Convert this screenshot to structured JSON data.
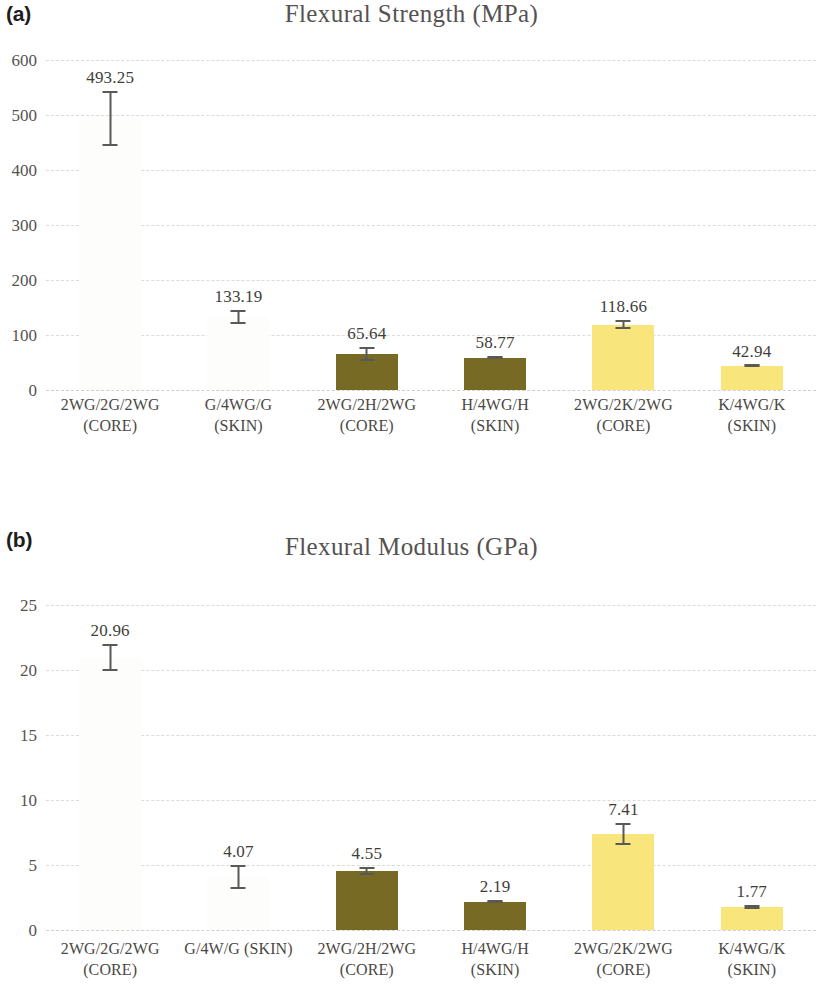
{
  "figure": {
    "panels": [
      {
        "panel_label": "(a)",
        "title": "Flexural Strength (MPa)"
      },
      {
        "panel_label": "(b)",
        "title": "Flexural Modulus (GPa)"
      }
    ]
  },
  "chart_data": [
    {
      "type": "bar",
      "panel": "(a)",
      "title": "Flexural Strength (MPa)",
      "xlabel": "",
      "ylabel": "",
      "ylim": [
        0,
        600
      ],
      "yticks": [
        0,
        100,
        200,
        300,
        400,
        500,
        600
      ],
      "ytick_labels": [
        "0",
        "100",
        "200",
        "300",
        "400",
        "500",
        "600"
      ],
      "grid": true,
      "legend": "none",
      "categories": [
        "2WG/2G/2WG\n(CORE)",
        "G/4WG/G\n(SKIN)",
        "2WG/2H/2WG\n(CORE)",
        "H/4WG/H\n(SKIN)",
        "2WG/2K/2WG\n(CORE)",
        "K/4WG/K\n(SKIN)"
      ],
      "values": [
        493.25,
        133.19,
        65.64,
        58.77,
        118.66,
        42.94
      ],
      "value_labels": [
        "493.25",
        "133.19",
        "65.64",
        "58.77",
        "118.66",
        "42.94"
      ],
      "errors": [
        50.0,
        13.0,
        13.0,
        2.5,
        8.0,
        2.0
      ],
      "bar_colors": [
        "#fdfdfc",
        "#fdfdfc",
        "#776a24",
        "#776a24",
        "#f8e57c",
        "#f8e57c"
      ],
      "bar_styles": [
        "blank",
        "blank",
        "olive",
        "olive",
        "yellow",
        "yellow"
      ]
    },
    {
      "type": "bar",
      "panel": "(b)",
      "title": "Flexural Modulus (GPa)",
      "xlabel": "",
      "ylabel": "",
      "ylim": [
        0,
        25
      ],
      "yticks": [
        0,
        5,
        10,
        15,
        20,
        25
      ],
      "ytick_labels": [
        "0",
        "5",
        "10",
        "15",
        "20",
        "25"
      ],
      "grid": true,
      "legend": "none",
      "categories": [
        "2WG/2G/2WG\n(CORE)",
        "G/4W/G (SKIN)",
        "2WG/2H/2WG\n(CORE)",
        "H/4WG/H\n(SKIN)",
        "2WG/2K/2WG\n(CORE)",
        "K/4WG/K\n(SKIN)"
      ],
      "values": [
        20.96,
        4.07,
        4.55,
        2.19,
        7.41,
        1.77
      ],
      "value_labels": [
        "20.96",
        "4.07",
        "4.55",
        "2.19",
        "7.41",
        "1.77"
      ],
      "errors": [
        1.05,
        0.95,
        0.28,
        0.13,
        0.85,
        0.18
      ],
      "bar_colors": [
        "#fdfdfc",
        "#fdfdfc",
        "#776a24",
        "#776a24",
        "#f8e57c",
        "#f8e57c"
      ],
      "bar_styles": [
        "blank",
        "blank",
        "olive",
        "olive",
        "yellow",
        "yellow"
      ]
    }
  ],
  "colors": {
    "olive": "#776a24",
    "yellow": "#f8e57c",
    "blank": "#fdfdfc",
    "error_bar": "#5b5954",
    "gridline": "#dddbd6",
    "text": "#4a4845"
  }
}
